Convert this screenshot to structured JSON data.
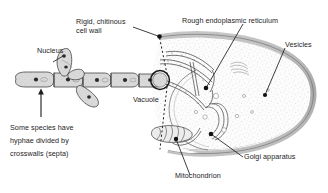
{
  "figure": {
    "title_partial": "Typical growth form of a fungus: a mycelium of hyphae",
    "labels": {
      "nucleus": "Nucleus",
      "cell_wall_line1": "Rigid, chitinous",
      "cell_wall_line2": "cell wall",
      "rough_er": "Rough endoplasmic reticulum",
      "vesicles": "Vesicles",
      "vacuole": "Vacuole",
      "golgi": "Golgi apparatus",
      "mitochondrion": "Mitochondrion",
      "septa_line1": "Some species have",
      "septa_line2": "hyphae divided by",
      "septa_line3_pre": "crosswalls (",
      "septa_line3_bold": "septa",
      "septa_line3_post": ")"
    },
    "colors": {
      "ink": "#1d1d1d",
      "cell_wall": "#b4b4b4",
      "cell_wall_dark": "#8e8e8e",
      "cytoplasm": "#fbfbfb",
      "hypha_fill": "#d8d8d8",
      "organelle_stroke": "#555555",
      "stipple": "#9a9a9a",
      "background": "#ffffff"
    },
    "structures": {
      "hypha_chain": "segmented-hyphal-filament-with-nuclei-and-septa",
      "magnifier": "magnification-circle-on-hypha-tip",
      "magnify_lines": "dotted-expansion-lines",
      "large_cell": "enlarged-hyphal-cell-cross-section"
    }
  }
}
